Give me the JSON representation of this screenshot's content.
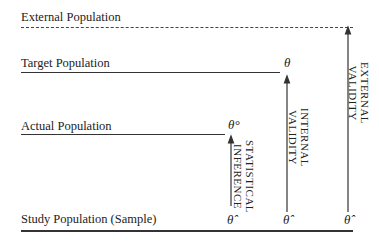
{
  "levels": {
    "external": {
      "label": "External Population",
      "style": "dashed"
    },
    "target": {
      "label": "Target Population",
      "symbol": "θ"
    },
    "actual": {
      "label": "Actual Population",
      "symbol": "θ°"
    },
    "study": {
      "label": "Study Population (Sample)",
      "symbols": [
        "θ̂",
        "θ̂",
        "θ̂"
      ]
    }
  },
  "arrows": {
    "statistical": {
      "line1": "STATISTICAL",
      "line2": "INFERENCE"
    },
    "internal": {
      "line1": "INTERNAL",
      "line2": "VALIDITY"
    },
    "external": {
      "line1": "EXTERNAL",
      "line2": "VALIDITY"
    }
  }
}
